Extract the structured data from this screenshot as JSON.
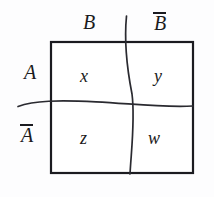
{
  "figure": {
    "type": "two-way-partition-diagram",
    "title": "",
    "colors": {
      "background": "#fdfdfe",
      "border": "#1b1b20",
      "divider": "#2a2a30",
      "text": "#1b1b20"
    },
    "box": {
      "left": 51,
      "top": 42,
      "right": 193,
      "bottom": 173,
      "border_width": 2.2
    },
    "column_labels": [
      {
        "id": "col-b",
        "text": "B",
        "overline": false,
        "x": 89,
        "y": 24
      },
      {
        "id": "col-b-bar",
        "text": "B",
        "overline": true,
        "x": 161,
        "y": 24
      }
    ],
    "row_labels": [
      {
        "id": "row-a",
        "text": "A",
        "overline": false,
        "x": 30,
        "y": 73
      },
      {
        "id": "row-a-bar",
        "text": "A",
        "overline": true,
        "x": 27,
        "y": 135
      }
    ],
    "cells": [
      {
        "id": "cell-x",
        "text": "x",
        "row": "A",
        "column": "B",
        "x": 85,
        "y": 76
      },
      {
        "id": "cell-y",
        "text": "y",
        "row": "A",
        "column": "B-bar",
        "x": 158,
        "y": 76
      },
      {
        "id": "cell-z",
        "text": "z",
        "row": "A-bar",
        "column": "B",
        "x": 85,
        "y": 138
      },
      {
        "id": "cell-w",
        "text": "w",
        "row": "A-bar",
        "column": "B-bar",
        "x": 155,
        "y": 138
      }
    ],
    "dividers": [
      {
        "id": "vertical-divider",
        "orientation": "vertical",
        "path": "M 126.5 16 C 124.0 42, 126.5 66, 132.0 94 C 135.2 118, 131.5 148, 130.0 174"
      },
      {
        "id": "horizontal-divider",
        "orientation": "horizontal",
        "path": "M 18 106.5 C 34 100.5, 58 100.0, 96 101.8 C 132 103.6, 160 107.6, 193 106.0"
      }
    ]
  }
}
